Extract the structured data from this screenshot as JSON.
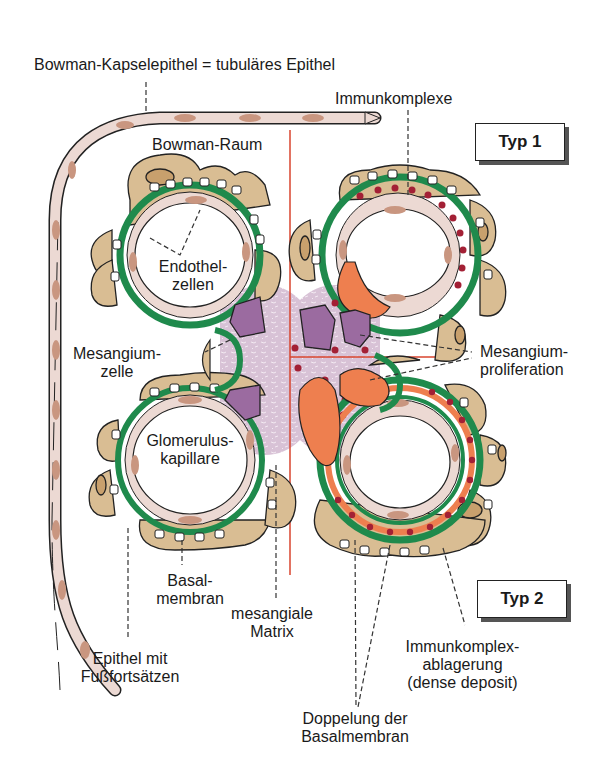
{
  "figure": {
    "labels": {
      "bowman_capsule_epithelium": "Bowman-Kapselepithel = tubuläres Epithel",
      "immune_complexes": "Immunkomplexe",
      "bowman_space": "Bowman-Raum",
      "endothelial_cells_1": "Endothel-",
      "endothelial_cells_2": "zellen",
      "mesangial_cell_1": "Mesangium-",
      "mesangial_cell_2": "zelle",
      "mesangial_proliferation_1": "Mesangium-",
      "mesangial_proliferation_2": "proliferation",
      "glomerular_capillary_1": "Glomerulus-",
      "glomerular_capillary_2": "kapillare",
      "basement_membrane_1": "Basal-",
      "basement_membrane_2": "membran",
      "mesangial_matrix_1": "mesangiale",
      "mesangial_matrix_2": "Matrix",
      "epithelium_foot_processes_1": "Epithel mit",
      "epithelium_foot_processes_2": "Fußfortsätzen",
      "immune_complex_deposit_1": "Immunkomplex-",
      "immune_complex_deposit_2": "ablagerung",
      "immune_complex_deposit_3": "(dense deposit)",
      "bm_doubling_1": "Doppelung der",
      "bm_doubling_2": "Basalmembran"
    },
    "type_boxes": {
      "type1": "Typ 1",
      "type2": "Typ 2"
    },
    "colors": {
      "basement_membrane": "#1f8a4c",
      "podocyte": "#d9bd93",
      "capsule_cell": "#ecd9d3",
      "nucleus": "#c99680",
      "mesangial_cell": "#9b6ba0",
      "mesangial_matrix": "#d9c3d6",
      "proliferating_cell": "#ee7f4f",
      "immune_complex": "#a32035",
      "divider_line": "#d9442e"
    }
  }
}
